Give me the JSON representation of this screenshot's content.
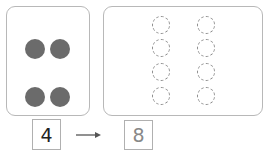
{
  "diagram": {
    "left_panel": {
      "dots": [
        {
          "cx": 35,
          "cy": 49
        },
        {
          "cx": 60,
          "cy": 49
        },
        {
          "cx": 35,
          "cy": 97
        },
        {
          "cx": 60,
          "cy": 97
        }
      ],
      "dot_color": "#6b6b6b"
    },
    "right_panel": {
      "rings": [
        {
          "cx": 161,
          "cy": 25
        },
        {
          "cx": 206,
          "cy": 25
        },
        {
          "cx": 161,
          "cy": 48
        },
        {
          "cx": 206,
          "cy": 48
        },
        {
          "cx": 161,
          "cy": 72
        },
        {
          "cx": 206,
          "cy": 72
        },
        {
          "cx": 161,
          "cy": 96
        },
        {
          "cx": 206,
          "cy": 96
        }
      ],
      "ring_color": "#8a8a8a"
    },
    "input_value": "4",
    "output_value": "8",
    "arrow_label": "maps to"
  }
}
